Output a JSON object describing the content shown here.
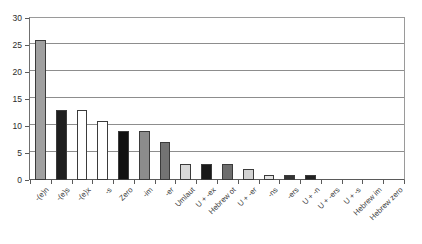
{
  "chart_data": {
    "type": "bar",
    "title": "",
    "subtitle": "",
    "xlabel": "",
    "ylabel": "",
    "ylim": [
      0,
      30
    ],
    "ytick_labels": [
      "0",
      "5",
      "10",
      "15",
      "20",
      "25",
      "30"
    ],
    "ytick_values": [
      0,
      5,
      10,
      15,
      20,
      25,
      30
    ],
    "grid": true,
    "legend": "none",
    "categories": [
      "-(e)n",
      "-(e)s",
      "-(e)x",
      "-s",
      "Zero",
      "-im",
      "-er",
      "Umlaut",
      "U + -ex",
      "Hebrew ot",
      "U + -er",
      "-ns",
      "-ers",
      "U + -n",
      "U + -ers",
      "U + -s",
      "Hebrew im",
      "Hebrew zero"
    ],
    "values": [
      26,
      13,
      13,
      11,
      9,
      9,
      7,
      3,
      3,
      3,
      2,
      1,
      1,
      1,
      0,
      0,
      0,
      0
    ],
    "bar_colors": [
      "#a0a0a0",
      "#1f1f1f",
      "#ffffff",
      "#ffffff",
      "#111111",
      "#8c8c8c",
      "#737373",
      "#d8d8d8",
      "#1a1a1a",
      "#6e6e6e",
      "#d3d3d3",
      "#e4e4e4",
      "#333333",
      "#222222",
      "#ffffff",
      "#ffffff",
      "#ffffff",
      "#ffffff"
    ],
    "bar_border_color": "#3b3b3b",
    "axis_color": "#5a5a5a",
    "gridline_color": "#8d8d8d",
    "plot_background": "#ffffff"
  }
}
